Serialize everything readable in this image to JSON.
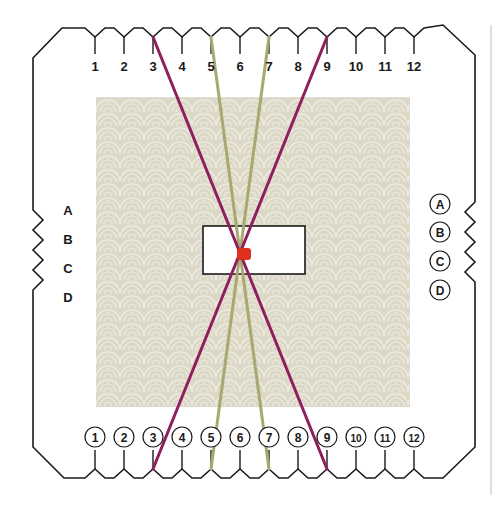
{
  "diagram": {
    "title": "",
    "top_slots": [
      "1",
      "2",
      "3",
      "4",
      "5",
      "6",
      "7",
      "8",
      "9",
      "10",
      "11",
      "12"
    ],
    "bottom_slots": [
      "1",
      "2",
      "3",
      "4",
      "5",
      "6",
      "7",
      "8",
      "9",
      "10",
      "11",
      "12"
    ],
    "left_notches": [
      "A",
      "B",
      "C",
      "D"
    ],
    "right_notches": [
      "A",
      "B",
      "C",
      "D"
    ],
    "threads": [
      {
        "color": "#8e1f5e",
        "from_top": "3",
        "to_bottom": "9"
      },
      {
        "color": "#8e1f5e",
        "from_top": "9",
        "to_bottom": "3"
      },
      {
        "color": "#a8a870",
        "from_top": "5",
        "to_bottom": "7"
      },
      {
        "color": "#a8a870",
        "from_top": "7",
        "to_bottom": "5"
      }
    ],
    "knot_color": "#e0301e",
    "card_outline_color": "#1a1a1a",
    "fabric_color": "#dcd8c8"
  }
}
